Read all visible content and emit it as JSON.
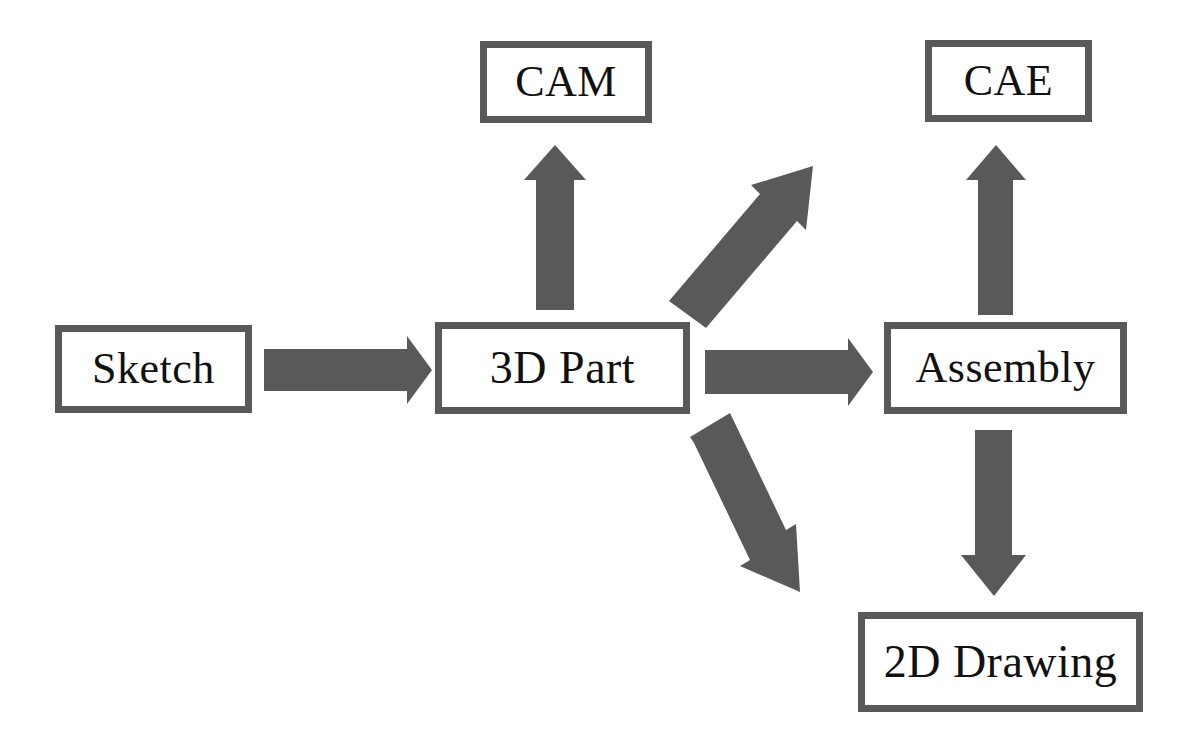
{
  "diagram": {
    "background_color": "#ffffff",
    "box_border_color": "#595959",
    "box_fill_color": "#ffffff",
    "box_border_width": 7,
    "text_color": "#111111",
    "arrow_color": "#595959",
    "nodes": [
      {
        "id": "sketch",
        "label": "Sketch",
        "x": 55,
        "y": 325,
        "width": 197,
        "height": 88,
        "font_size": 44
      },
      {
        "id": "cam",
        "label": "CAM",
        "x": 480,
        "y": 41,
        "width": 172,
        "height": 82,
        "font_size": 44
      },
      {
        "id": "part3d",
        "label": "3D Part",
        "x": 435,
        "y": 322,
        "width": 255,
        "height": 92,
        "font_size": 46
      },
      {
        "id": "cae",
        "label": "CAE",
        "x": 925,
        "y": 40,
        "width": 167,
        "height": 82,
        "font_size": 44
      },
      {
        "id": "assembly",
        "label": "Assembly",
        "x": 884,
        "y": 322,
        "width": 243,
        "height": 92,
        "font_size": 44
      },
      {
        "id": "drawing2d",
        "label": "2D Drawing",
        "x": 858,
        "y": 612,
        "width": 285,
        "height": 100,
        "font_size": 46
      }
    ],
    "arrows": [
      {
        "id": "sketch-to-3dpart",
        "from": "sketch",
        "to": "part3d",
        "direction": "right",
        "points": "264,349 407,349 407,336 432,370 407,404 407,391 264,391"
      },
      {
        "id": "3dpart-to-cam",
        "from": "part3d",
        "to": "cam",
        "direction": "up",
        "points": "536,310 536,180 524,180 555,145 586,180 574,180 574,310"
      },
      {
        "id": "3dpart-to-cae",
        "from": "part3d",
        "to": "cae",
        "direction": "diagonal-up-right",
        "points": "669,301 760,194 751,185 813,166 806,230 797,221 706,328"
      },
      {
        "id": "3dpart-to-assembly",
        "from": "part3d",
        "to": "assembly",
        "direction": "right",
        "points": "705,350 848,350 848,338 873,372 848,406 848,394 705,394"
      },
      {
        "id": "3dpart-to-2ddrawing",
        "from": "part3d",
        "to": "drawing2d",
        "direction": "diagonal-down-right",
        "points": "690,437 730,413 786,530 796,524 800,592 740,566 750,560 694,443"
      },
      {
        "id": "assembly-to-cae",
        "from": "assembly",
        "to": "cae",
        "direction": "up",
        "points": "978,315 978,180 966,180 996,145 1026,180 1013,180 1013,315"
      },
      {
        "id": "assembly-to-2ddrawing",
        "from": "assembly",
        "to": "drawing2d",
        "direction": "down",
        "points": "975,430 1012,430 1012,555 1026,555 994,596 961,555 975,555"
      }
    ]
  }
}
